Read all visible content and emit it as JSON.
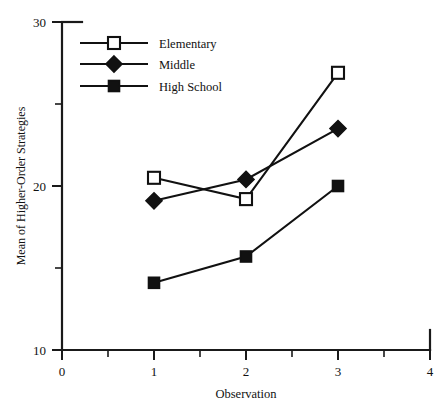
{
  "chart_data": {
    "type": "line",
    "title": "",
    "xlabel": "Observation",
    "ylabel": "Mean of Higher-Order Strategies",
    "x": [
      1,
      2,
      3
    ],
    "xlim": [
      0,
      4
    ],
    "ylim": [
      10,
      30
    ],
    "x_ticks": [
      "0",
      "1",
      "2",
      "3",
      "4"
    ],
    "x_tick_values": [
      0,
      1,
      2,
      3,
      4
    ],
    "x_minor_tick_values": [
      0.5,
      1.5,
      2.5,
      3.5
    ],
    "y_ticks": [
      "10",
      "20",
      "30"
    ],
    "y_tick_values": [
      10,
      20,
      30
    ],
    "y_minor_tick_values": [
      15,
      25
    ],
    "grid": false,
    "legend_position": "top-left",
    "series": [
      {
        "name": "Elementary",
        "marker": "open-square",
        "color": "#111111",
        "values": [
          20.5,
          19.2,
          26.9
        ]
      },
      {
        "name": "Middle",
        "marker": "filled-diamond",
        "color": "#111111",
        "values": [
          19.1,
          20.4,
          23.5
        ]
      },
      {
        "name": "High School",
        "marker": "filled-square",
        "color": "#111111",
        "values": [
          14.1,
          15.7,
          20.0
        ]
      }
    ]
  },
  "legend": {
    "entries": [
      {
        "label": "Elementary"
      },
      {
        "label": "Middle"
      },
      {
        "label": "High School"
      }
    ]
  },
  "axes": {
    "x_title": "Observation",
    "y_title": "Mean of Higher-Order Strategies",
    "x_tick_0": "0",
    "x_tick_1": "1",
    "x_tick_2": "2",
    "x_tick_3": "3",
    "x_tick_4": "4",
    "y_tick_10": "10",
    "y_tick_20": "20",
    "y_tick_30": "30"
  }
}
